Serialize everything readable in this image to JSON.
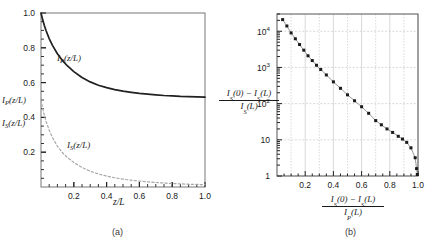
{
  "figure": {
    "panel_a_caption": "(a)",
    "panel_b_caption": "(b)"
  },
  "chart_data": [
    {
      "type": "line",
      "panel": "a",
      "title": "",
      "xlabel": "z/L",
      "ylabel": "",
      "y_axis_curve_labels": [
        "I_P(z/L)",
        "I_S(z/L)"
      ],
      "xlim": [
        0,
        1.0
      ],
      "ylim": [
        0,
        1.0
      ],
      "xticks": [
        0.2,
        0.4,
        0.6,
        0.8,
        1.0
      ],
      "xticklabels": [
        "0.2",
        "0.4",
        "0.6",
        "0.8",
        "1.0"
      ],
      "yticks": [
        0.2,
        0.4,
        0.6,
        0.8,
        1.0
      ],
      "yticklabels": [
        "0.2",
        "0.4",
        "0.6",
        "0.8",
        "1.0"
      ],
      "grid": false,
      "legend": "inline-annotation",
      "series": [
        {
          "name": "I_P(z/L)",
          "style": "solid",
          "color": "#202020",
          "annotation": "I_P(z/L)",
          "annotation_xy": [
            0.3,
            0.7
          ],
          "x": [
            0.0,
            0.01,
            0.02,
            0.03,
            0.05,
            0.07,
            0.1,
            0.13,
            0.16,
            0.2,
            0.25,
            0.3,
            0.35,
            0.4,
            0.45,
            0.5,
            0.55,
            0.6,
            0.65,
            0.7,
            0.75,
            0.8,
            0.85,
            0.9,
            0.95,
            1.0
          ],
          "y": [
            1.0,
            0.962,
            0.93,
            0.901,
            0.853,
            0.814,
            0.766,
            0.728,
            0.697,
            0.663,
            0.629,
            0.604,
            0.585,
            0.571,
            0.56,
            0.551,
            0.544,
            0.538,
            0.534,
            0.53,
            0.526,
            0.524,
            0.521,
            0.519,
            0.518,
            0.516
          ]
        },
        {
          "name": "I_S(z/L)",
          "style": "dashed",
          "color": "#a8a8a8",
          "annotation": "I_S(z/L)",
          "annotation_xy": [
            0.3,
            0.215
          ],
          "x": [
            0.0,
            0.01,
            0.02,
            0.03,
            0.05,
            0.07,
            0.1,
            0.13,
            0.16,
            0.2,
            0.25,
            0.3,
            0.35,
            0.4,
            0.45,
            0.5,
            0.55,
            0.6,
            0.65,
            0.7,
            0.75,
            0.8,
            0.85,
            0.9,
            0.95,
            1.0
          ],
          "y": [
            0.5,
            0.452,
            0.413,
            0.38,
            0.326,
            0.284,
            0.234,
            0.198,
            0.17,
            0.141,
            0.112,
            0.091,
            0.075,
            0.063,
            0.053,
            0.045,
            0.039,
            0.034,
            0.03,
            0.026,
            0.023,
            0.02,
            0.018,
            0.016,
            0.015,
            0.013
          ]
        }
      ]
    },
    {
      "type": "scatter",
      "panel": "b",
      "title": "",
      "xlabel_num": "I_S(0) − I_S(L)",
      "xlabel_den": "I_P(L)",
      "ylabel_num": "I_S(0) − I_S(L)",
      "ylabel_den": "I_S(L)",
      "xlim": [
        0,
        1.0
      ],
      "ylim": [
        1,
        30000
      ],
      "yscale": "log",
      "xticks": [
        0.2,
        0.4,
        0.6,
        0.8,
        1.0
      ],
      "xticklabels": [
        "0.2",
        "0.4",
        "0.6",
        "0.8",
        "1.0"
      ],
      "yticks": [
        1,
        10,
        100,
        1000,
        10000
      ],
      "yticklabels": [
        "1",
        "10",
        "10",
        "10",
        "10"
      ],
      "yticksup": [
        "",
        "",
        "2",
        "3",
        "4"
      ],
      "grid": true,
      "marker": "square",
      "marker_color": "#1a1a1a",
      "fit_line_color": "#999999",
      "points": [
        {
          "x": 0.04,
          "y": 21000
        },
        {
          "x": 0.07,
          "y": 14000
        },
        {
          "x": 0.1,
          "y": 9000
        },
        {
          "x": 0.13,
          "y": 6200
        },
        {
          "x": 0.16,
          "y": 4300
        },
        {
          "x": 0.19,
          "y": 3000
        },
        {
          "x": 0.22,
          "y": 2100
        },
        {
          "x": 0.25,
          "y": 1550
        },
        {
          "x": 0.28,
          "y": 1150
        },
        {
          "x": 0.31,
          "y": 880
        },
        {
          "x": 0.35,
          "y": 620
        },
        {
          "x": 0.4,
          "y": 400
        },
        {
          "x": 0.45,
          "y": 265
        },
        {
          "x": 0.5,
          "y": 175
        },
        {
          "x": 0.55,
          "y": 120
        },
        {
          "x": 0.6,
          "y": 82
        },
        {
          "x": 0.65,
          "y": 54
        },
        {
          "x": 0.7,
          "y": 34
        },
        {
          "x": 0.74,
          "y": 26
        },
        {
          "x": 0.78,
          "y": 20
        },
        {
          "x": 0.82,
          "y": 16
        },
        {
          "x": 0.86,
          "y": 12.5
        },
        {
          "x": 0.89,
          "y": 10.5
        },
        {
          "x": 0.92,
          "y": 8.5
        },
        {
          "x": 0.95,
          "y": 6.0
        },
        {
          "x": 0.98,
          "y": 3.2
        },
        {
          "x": 0.99,
          "y": 1.6
        },
        {
          "x": 0.995,
          "y": 1.1
        }
      ]
    }
  ]
}
